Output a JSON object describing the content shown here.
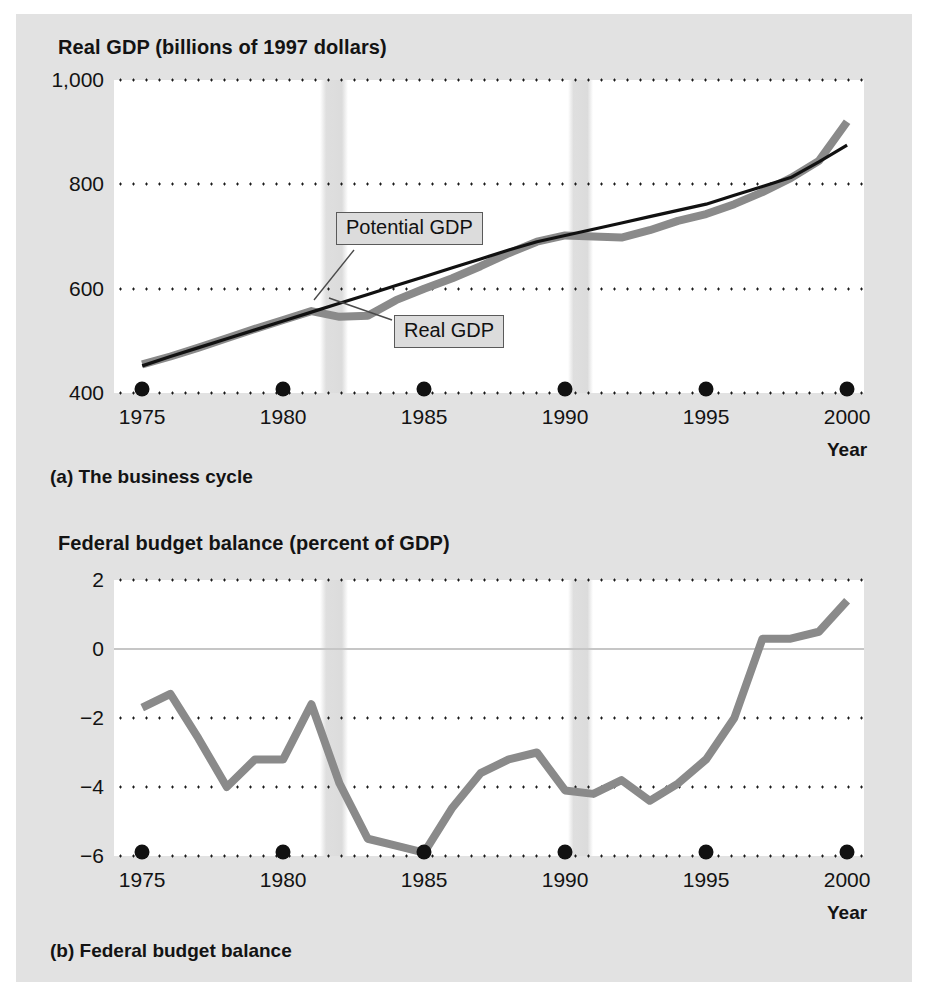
{
  "figure": {
    "panels": [
      {
        "id": "a",
        "title": "Real GDP (billions of 1997 dollars)",
        "caption": "(a) The business cycle",
        "axis_name": "Year"
      },
      {
        "id": "b",
        "title": "Federal budget balance (percent of GDP)",
        "caption": "(b) Federal budget balance",
        "axis_name": "Year"
      }
    ],
    "callouts": {
      "potential_gdp": "Potential GDP",
      "real_gdp": "Real GDP"
    },
    "colors": {
      "page_background": "#e2e2e2",
      "plot_background": "#ffffff",
      "real_gdp_line": "#8a8a8a",
      "potential_gdp_line": "#111111",
      "budget_line": "#8a8a8a",
      "gridline": "#1a1a1a",
      "zero_line": "#c6c6c6",
      "recession_band": "#c4c4c4",
      "callout_fill": "#dcdcdc",
      "callout_border": "#5a5a5a",
      "text": "#131313"
    }
  },
  "chart_data": [
    {
      "type": "line",
      "id": "business-cycle",
      "title": "Real GDP (billions of 1997 dollars)",
      "xlabel": "Year",
      "ylabel": "Real GDP (billions of 1997 dollars)",
      "xlim": [
        1974,
        2000.6
      ],
      "ylim": [
        400,
        1000
      ],
      "xticks": [
        1975,
        1980,
        1985,
        1990,
        1995,
        2000
      ],
      "yticks": [
        400,
        600,
        800,
        1000
      ],
      "ytick_labels": [
        "400",
        "600",
        "800",
        "1,000"
      ],
      "grid": "horizontal-dotted",
      "legend": "inline-callouts",
      "annotations": [
        "Potential GDP",
        "Real GDP"
      ],
      "recession_bands": [
        {
          "start": 1981.3,
          "end": 1982.3
        },
        {
          "start": 1990.1,
          "end": 1991.0
        }
      ],
      "x": [
        1975,
        1976,
        1977,
        1978,
        1979,
        1980,
        1981,
        1982,
        1983,
        1984,
        1985,
        1986,
        1987,
        1988,
        1989,
        1990,
        1991,
        1992,
        1993,
        1994,
        1995,
        1996,
        1997,
        1998,
        1999,
        2000
      ],
      "series": [
        {
          "name": "Real GDP",
          "color": "#8a8a8a",
          "values": [
            455,
            470,
            487,
            505,
            523,
            540,
            557,
            546,
            548,
            578,
            600,
            620,
            643,
            668,
            690,
            702,
            700,
            698,
            712,
            730,
            743,
            762,
            785,
            812,
            845,
            920
          ]
        },
        {
          "name": "Potential GDP",
          "color": "#111111",
          "values": [
            452,
            470,
            487,
            504,
            521,
            538,
            555,
            572,
            589,
            606,
            623,
            640,
            657,
            674,
            690,
            702,
            714,
            726,
            738,
            750,
            762,
            779,
            796,
            813,
            843,
            875
          ]
        }
      ]
    },
    {
      "type": "line",
      "id": "federal-budget-balance",
      "title": "Federal budget balance (percent of GDP)",
      "xlabel": "Year",
      "ylabel": "Federal budget balance (percent of GDP)",
      "xlim": [
        1974,
        2000.6
      ],
      "ylim": [
        -6,
        2
      ],
      "xticks": [
        1975,
        1980,
        1985,
        1990,
        1995,
        2000
      ],
      "yticks": [
        -6,
        -4,
        -2,
        0,
        2
      ],
      "ytick_labels": [
        "−6",
        "−4",
        "−2",
        "0",
        "2"
      ],
      "grid": "horizontal-dotted",
      "zero_line": 0,
      "recession_bands": [
        {
          "start": 1981.3,
          "end": 1982.3
        },
        {
          "start": 1990.1,
          "end": 1991.0
        }
      ],
      "x": [
        1975,
        1976,
        1977,
        1978,
        1979,
        1980,
        1981,
        1982,
        1983,
        1984,
        1985,
        1986,
        1987,
        1988,
        1989,
        1990,
        1991,
        1992,
        1993,
        1994,
        1995,
        1996,
        1997,
        1998,
        1999,
        2000
      ],
      "series": [
        {
          "name": "Federal budget balance",
          "color": "#8a8a8a",
          "values": [
            -1.7,
            -1.3,
            -2.6,
            -4.0,
            -3.2,
            -3.2,
            -1.6,
            -3.9,
            -5.5,
            -5.7,
            -5.9,
            -4.6,
            -3.6,
            -3.2,
            -3.0,
            -4.1,
            -4.2,
            -3.8,
            -4.4,
            -3.9,
            -3.2,
            -2.0,
            0.3,
            0.3,
            0.5,
            1.4
          ]
        }
      ]
    }
  ]
}
